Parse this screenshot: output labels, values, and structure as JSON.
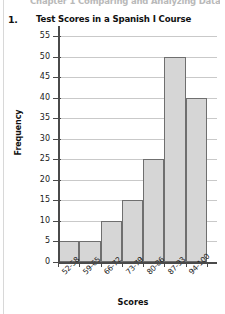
{
  "page": {
    "cut_off_header": "Chapter 1  Comparing and Analyzing Data  (pp. 1-20)",
    "item_number": "1."
  },
  "chart_data": {
    "type": "bar",
    "title": "Test Scores in a Spanish I Course",
    "xlabel": "Scores",
    "ylabel": "Frequency",
    "categories": [
      "52-58",
      "59-65",
      "66-72",
      "73-79",
      "80-86",
      "87-93",
      "94-100"
    ],
    "values": [
      5,
      5,
      10,
      15,
      25,
      50,
      40
    ],
    "ylim": [
      0,
      55
    ],
    "ytick_labels": [
      "0",
      "5",
      "10",
      "15",
      "20",
      "25",
      "30",
      "35",
      "40",
      "45",
      "50",
      "55"
    ],
    "ytick_values": [
      0,
      5,
      10,
      15,
      20,
      25,
      30,
      35,
      40,
      45,
      50,
      55
    ],
    "grid": true,
    "legend": "none",
    "bar_fill_color": "#d6d6d6",
    "bar_edge_color": "#6f6f6f",
    "axis_color": "#4a4a4a",
    "gridline_color": "#c9c9c9"
  }
}
